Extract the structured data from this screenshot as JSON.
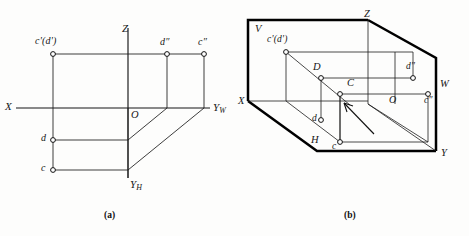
{
  "figure": {
    "kind": "descriptive-geometry-projection",
    "panels": [
      {
        "id": "a",
        "caption": "(a)",
        "description": "Unfolded three-view projection layout of points C and D",
        "axes": [
          {
            "name": "X",
            "label": "X",
            "sub": ""
          },
          {
            "name": "Z",
            "label": "Z",
            "sub": ""
          },
          {
            "name": "YW",
            "label": "Y",
            "sub": "W"
          },
          {
            "name": "YH",
            "label": "Y",
            "sub": "H"
          }
        ],
        "origin_label": "O",
        "points": [
          {
            "name": "front-projection-cd",
            "label": "c'(d')"
          },
          {
            "name": "side-projection-d",
            "label": "d″"
          },
          {
            "name": "side-projection-c",
            "label": "c″"
          },
          {
            "name": "top-projection-d",
            "label": "d"
          },
          {
            "name": "top-projection-c",
            "label": "c"
          }
        ]
      },
      {
        "id": "b",
        "caption": "(b)",
        "description": "Pictorial view of the three mutually perpendicular projection planes V, H, W",
        "planes": [
          {
            "name": "frontal-plane",
            "label": "V"
          },
          {
            "name": "horizontal-plane",
            "label": "H"
          },
          {
            "name": "profile-plane",
            "label": "W"
          }
        ],
        "axes": [
          {
            "name": "X",
            "label": "X"
          },
          {
            "name": "Y",
            "label": "Y"
          },
          {
            "name": "Z",
            "label": "Z"
          }
        ],
        "origin_label": "O",
        "points": [
          {
            "name": "front-projection-cd",
            "label": "c'(d')"
          },
          {
            "name": "space-point-D",
            "label": "D"
          },
          {
            "name": "space-point-C",
            "label": "C"
          },
          {
            "name": "side-projection-d",
            "label": "d″"
          },
          {
            "name": "side-projection-c",
            "label": "c″"
          },
          {
            "name": "top-projection-d",
            "label": "d"
          },
          {
            "name": "top-projection-c",
            "label": "c"
          }
        ],
        "annotation": {
          "name": "pointer-arrow",
          "target": "space-point-C"
        }
      }
    ]
  },
  "style": {
    "line_color": "#161616",
    "thick_line_color": "#000000",
    "marker_fill": "#ffffff",
    "background": "#fdfdfc"
  }
}
